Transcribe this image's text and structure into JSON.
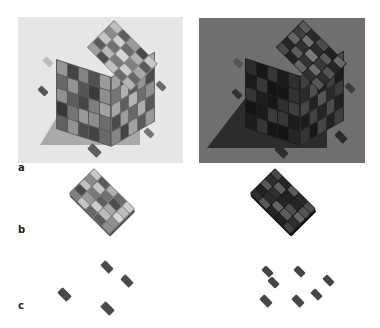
{
  "figure": {
    "panels": [
      {
        "id": "a-left",
        "label": "",
        "background": "#e6e6e6",
        "content": "5x5x5 cube of coloured blocks, light background, with loose tiles"
      },
      {
        "id": "a-right",
        "label": "",
        "background": "#6f6f6f",
        "content": "same 5x5x5 cube, dark rendering on grey background, with loose tiles"
      }
    ],
    "row_labels": {
      "a": "a",
      "b": "b",
      "c": "c"
    },
    "cube_top_left": [
      [
        "#bdbdbd",
        "#5e5e5e",
        "#9a9a9a",
        "#4a4a4a",
        "#c8c8c8"
      ],
      [
        "#8a8a8a",
        "#cfcfcf",
        "#6b6b6b",
        "#b0b0b0",
        "#5a5a5a"
      ],
      [
        "#c4c4c4",
        "#707070",
        "#d6d6d6",
        "#808080",
        "#a8a8a8"
      ],
      [
        "#5a5a5a",
        "#b8b8b8",
        "#7a7a7a",
        "#cccccc",
        "#666666"
      ],
      [
        "#9e9e9e",
        "#4e4e4e",
        "#c0c0c0",
        "#6a6a6a",
        "#b4b4b4"
      ]
    ],
    "cube_top_right": [
      [
        "#5a5a5a",
        "#2a2a2a",
        "#4c4c4c",
        "#222222",
        "#6a6a6a"
      ],
      [
        "#3e3e3e",
        "#707070",
        "#2c2c2c",
        "#5a5a5a",
        "#262626"
      ],
      [
        "#666666",
        "#303030",
        "#7a7a7a",
        "#3a3a3a",
        "#545454"
      ],
      [
        "#262626",
        "#5e5e5e",
        "#343434",
        "#6e6e6e",
        "#2e2e2e"
      ],
      [
        "#4a4a4a",
        "#222222",
        "#646464",
        "#303030",
        "#585858"
      ]
    ],
    "layer_left": [
      [
        "#c8c8c8",
        "#5a5a5a",
        "#b0b0b0",
        "#6a6a6a",
        "#cfcfcf"
      ],
      [
        "#8a8a8a",
        "#c4c4c4",
        "#707070",
        "#4e4e4e",
        "#bdbdbd"
      ],
      [
        "#c0c0c0",
        "#7a7a7a",
        "#5e5e5e",
        "#a8a8a8",
        "#d6d6d6"
      ],
      [
        "#4a4a4a",
        "#9a9a9a",
        "#cccccc",
        "#bcbcbc",
        "#909090"
      ],
      [
        "#808080",
        "#c4c4c4",
        "#666666",
        "#5a5a5a",
        "#8e8e8e"
      ]
    ],
    "layer_right": [
      [
        "#4a4a4a",
        "#262626",
        "#5a5a5a",
        "#2a2a2a",
        "#4e4e4e"
      ],
      [
        "#2e2e2e",
        "#5e5e5e",
        "#222222",
        "#262626",
        "#545454"
      ],
      [
        "#585858",
        "#303030",
        "#262626",
        "#4e4e4e",
        "#686868"
      ],
      [
        "#222222",
        "#2c2c2c",
        "#646464",
        "#5c5c5c",
        "#2e2e2e"
      ],
      [
        "#303030",
        "#5a5a5a",
        "#262626",
        "#222222",
        "#404040"
      ]
    ],
    "loose_tiles_left_c": 4,
    "loose_tiles_right_c": 7
  }
}
